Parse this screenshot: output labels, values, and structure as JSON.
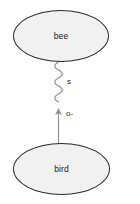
{
  "diagram": {
    "type": "graph",
    "background_color": "#ffffff",
    "node_fill_color": "#f1f1f1",
    "node_stroke_color": "#2b2b2b",
    "edge_color": "#8a8a8a",
    "text_color": "#1a1a1a",
    "nodes": [
      {
        "id": "bee",
        "label": "bee",
        "shape": "ellipse",
        "position": "top"
      },
      {
        "id": "bird",
        "label": "bird",
        "shape": "ellipse",
        "position": "bottom"
      }
    ],
    "edges": [
      {
        "id": "wavy-edge",
        "label": "s",
        "style": "wavy",
        "arrow": "none",
        "from": "bee",
        "to": "midpoint"
      },
      {
        "id": "arrow-edge",
        "label": "o-",
        "style": "straight",
        "arrow": "up",
        "from": "bird",
        "to": "midpoint"
      }
    ]
  }
}
